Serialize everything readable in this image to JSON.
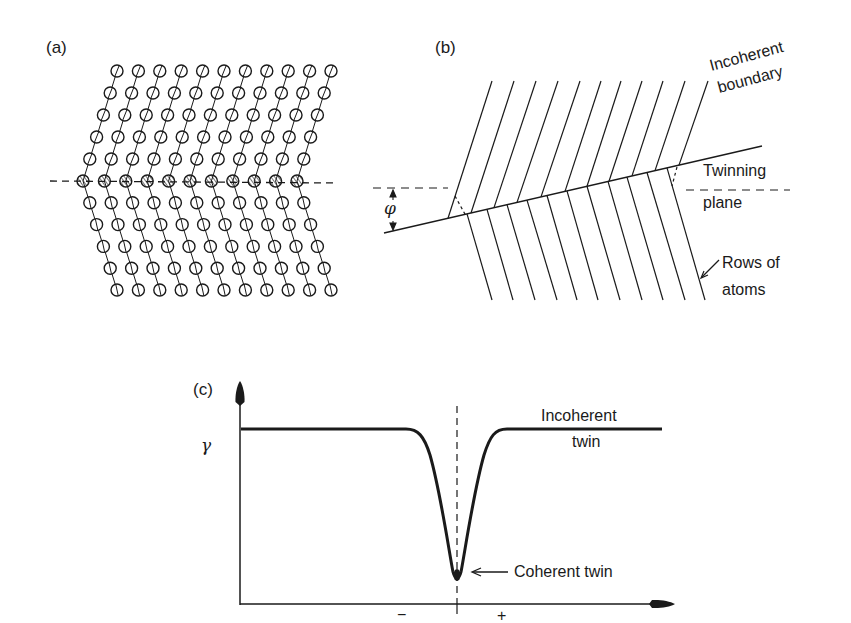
{
  "panels": {
    "a": {
      "label": "(a)",
      "atom_rows_above": 5,
      "atom_rows_below": 5,
      "atoms_per_row": 11,
      "boundary_style": "dashed",
      "boundary_atoms": "hatched"
    },
    "b": {
      "label": "(b)",
      "angle_symbol": "φ",
      "labels": {
        "incoherent_line1": "Incoherent",
        "incoherent_line2": "boundary",
        "twinning_line1": "Twinning",
        "twinning_line2": "plane",
        "rows_line1": "Rows of",
        "rows_line2": "atoms"
      }
    },
    "c": {
      "label": "(c)",
      "y_symbol": "γ",
      "x_minus": "−",
      "x_plus": "+",
      "labels": {
        "incoherent_line1": "Incoherent",
        "incoherent_line2": "twin",
        "coherent": "Coherent twin"
      }
    }
  },
  "colors": {
    "ink": "#1a1a1a",
    "background": "#ffffff"
  }
}
